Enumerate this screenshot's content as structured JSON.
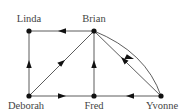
{
  "diagram": {
    "type": "directed-graph",
    "colors": {
      "edge": "#333333",
      "node": "#111111",
      "label": "#444444",
      "background": "#ffffff"
    },
    "nodes": [
      {
        "id": "linda",
        "label": "Linda",
        "x": 29,
        "y": 31,
        "label_x": 29,
        "label_y": 22
      },
      {
        "id": "brian",
        "label": "Brian",
        "x": 94,
        "y": 31,
        "label_x": 94,
        "label_y": 22
      },
      {
        "id": "deborah",
        "label": "Deborah",
        "x": 29,
        "y": 96,
        "label_x": 26,
        "label_y": 109
      },
      {
        "id": "fred",
        "label": "Fred",
        "x": 94,
        "y": 96,
        "label_x": 94,
        "label_y": 109
      },
      {
        "id": "yvonne",
        "label": "Yvonne",
        "x": 161,
        "y": 96,
        "label_x": 162,
        "label_y": 109
      }
    ],
    "edges": [
      {
        "from": "brian",
        "to": "linda",
        "shape": "straight"
      },
      {
        "from": "deborah",
        "to": "linda",
        "shape": "straight"
      },
      {
        "from": "deborah",
        "to": "brian",
        "shape": "straight"
      },
      {
        "from": "fred",
        "to": "brian",
        "shape": "straight"
      },
      {
        "from": "deborah",
        "to": "fred",
        "shape": "straight"
      },
      {
        "from": "yvonne",
        "to": "fred",
        "shape": "straight"
      },
      {
        "from": "yvonne",
        "to": "brian",
        "shape": "straight"
      },
      {
        "from": "brian",
        "to": "yvonne",
        "shape": "curved"
      }
    ]
  }
}
